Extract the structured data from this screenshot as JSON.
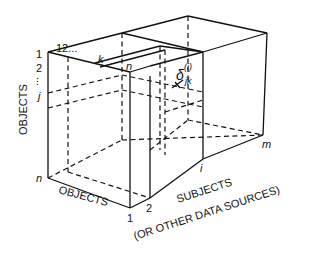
{
  "diagram": {
    "type": "three-way data box (objects x objects x subjects)",
    "axes": {
      "vertical": {
        "label": "OBJECTS",
        "ticks": [
          "1",
          "2",
          "...",
          "j",
          "n"
        ]
      },
      "front_horizontal": {
        "label": "OBJECTS",
        "ticks": [
          "1",
          "2",
          "...",
          "k",
          "n"
        ]
      },
      "depth": {
        "label_line1": "SUBJECTS",
        "label_line2": "(OR OTHER DATA SOURCES)",
        "ticks": [
          "1",
          "2",
          "i",
          "m"
        ]
      }
    },
    "top_labels": {
      "one_two": "12...",
      "k": "k",
      "n": "n"
    },
    "left_labels": {
      "one": "1",
      "two": "2",
      "dots": "...",
      "j": "j",
      "n": "n"
    },
    "bottom_labels": {
      "one": "1",
      "two": "2",
      "i": "i",
      "m": "m"
    },
    "cell_label": {
      "symbol": "δ",
      "superscript": "(i)",
      "subscript": "jk"
    },
    "colors": {
      "ink": "#111111",
      "background": "#ffffff"
    }
  }
}
